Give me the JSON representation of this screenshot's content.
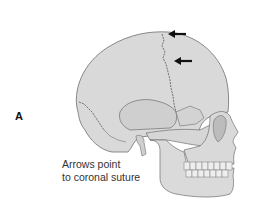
{
  "figure": {
    "panel_label": "A",
    "caption_lines": [
      "Arrows point",
      "to coronal suture"
    ],
    "colors": {
      "bone": "#d9d9d9",
      "bone_shade": "#bcbcbc",
      "outline": "#6f6f6f",
      "suture": "#555555",
      "arrow": "#111111",
      "background": "#ffffff"
    },
    "arrows": [
      {
        "name": "upper-arrow",
        "target": "coronal-suture"
      },
      {
        "name": "lower-arrow",
        "target": "coronal-suture"
      }
    ]
  }
}
